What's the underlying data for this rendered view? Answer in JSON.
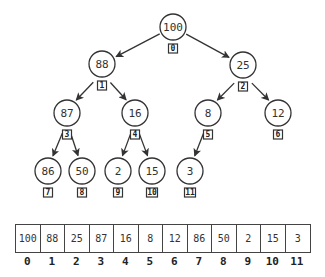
{
  "tree": {
    "nodes": [
      {
        "index": "0",
        "value": "100",
        "x": 173,
        "y": 27
      },
      {
        "index": "1",
        "value": "88",
        "x": 102,
        "y": 64
      },
      {
        "index": "2",
        "value": "25",
        "x": 243,
        "y": 65
      },
      {
        "index": "3",
        "value": "87",
        "x": 67,
        "y": 113
      },
      {
        "index": "4",
        "value": "16",
        "x": 135,
        "y": 113
      },
      {
        "index": "5",
        "value": "8",
        "x": 208,
        "y": 113
      },
      {
        "index": "6",
        "value": "12",
        "x": 278,
        "y": 113
      },
      {
        "index": "7",
        "value": "86",
        "x": 48,
        "y": 171
      },
      {
        "index": "8",
        "value": "50",
        "x": 82,
        "y": 171
      },
      {
        "index": "9",
        "value": "2",
        "x": 118,
        "y": 171
      },
      {
        "index": "10",
        "value": "15",
        "x": 152,
        "y": 171
      },
      {
        "index": "11",
        "value": "3",
        "x": 190,
        "y": 171
      }
    ],
    "edges": [
      [
        0,
        1
      ],
      [
        0,
        2
      ],
      [
        1,
        3
      ],
      [
        1,
        4
      ],
      [
        2,
        5
      ],
      [
        2,
        6
      ],
      [
        3,
        7
      ],
      [
        3,
        8
      ],
      [
        4,
        9
      ],
      [
        4,
        10
      ],
      [
        5,
        11
      ]
    ]
  },
  "array": {
    "values": [
      "100",
      "88",
      "25",
      "87",
      "16",
      "8",
      "12",
      "86",
      "50",
      "2",
      "15",
      "3"
    ],
    "indices": [
      "0",
      "1",
      "2",
      "3",
      "4",
      "5",
      "6",
      "7",
      "8",
      "9",
      "10",
      "11"
    ]
  }
}
